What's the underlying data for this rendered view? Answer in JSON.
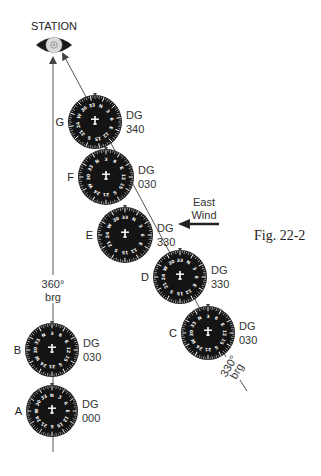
{
  "figure": {
    "caption": "Fig. 22-2",
    "station_label": "STATION",
    "wind_label_line1": "East",
    "wind_label_line2": "Wind",
    "bearing_360_line1": "360°",
    "bearing_360_line2": "brg",
    "bearing_330_line1": "330°",
    "bearing_330_line2": "brg",
    "colors": {
      "dial_face": "#141414",
      "dial_markings": "#ffffff",
      "lines": "#444444",
      "text": "#222222",
      "station_icon": "#1a1a1a"
    }
  },
  "dials": [
    {
      "id": "A",
      "label": "A",
      "dg_label": "DG",
      "dg_value": "000",
      "cx": 52,
      "cy": 411,
      "r": 26,
      "heading_deg": 0
    },
    {
      "id": "B",
      "label": "B",
      "dg_label": "DG",
      "dg_value": "030",
      "cx": 52,
      "cy": 350,
      "r": 27,
      "heading_deg": 30
    },
    {
      "id": "C",
      "label": "C",
      "dg_label": "DG",
      "dg_value": "030",
      "cx": 208,
      "cy": 333,
      "r": 27,
      "heading_deg": 30
    },
    {
      "id": "D",
      "label": "D",
      "dg_label": "DG",
      "dg_value": "330",
      "cx": 180,
      "cy": 277,
      "r": 27,
      "heading_deg": 330
    },
    {
      "id": "E",
      "label": "E",
      "dg_label": "DG",
      "dg_value": "330",
      "cx": 125,
      "cy": 235,
      "r": 28,
      "heading_deg": 330
    },
    {
      "id": "F",
      "label": "F",
      "dg_label": "DG",
      "dg_value": "030",
      "cx": 106,
      "cy": 177,
      "r": 28,
      "heading_deg": 30
    },
    {
      "id": "G",
      "label": "G",
      "dg_label": "DG",
      "dg_value": "340",
      "cx": 95,
      "cy": 122,
      "r": 27,
      "heading_deg": 340
    }
  ],
  "dial_numerals": [
    "N",
    "3",
    "6",
    "E",
    "12",
    "15",
    "S",
    "21",
    "24",
    "W",
    "30",
    "33"
  ]
}
